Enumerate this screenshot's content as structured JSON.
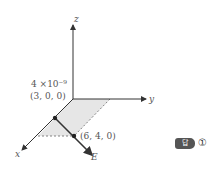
{
  "diagram": {
    "axes": {
      "x": "x",
      "y": "y",
      "z": "z"
    },
    "charge_label": "4 ×10⁻⁹",
    "point_a": "(3, 0, 0)",
    "point_b": "(6, 4, 0)",
    "field_label": "E",
    "shade_color": "#e6e6e6",
    "line_color": "#333333"
  },
  "answer": {
    "badge": "답",
    "choice": "①"
  }
}
